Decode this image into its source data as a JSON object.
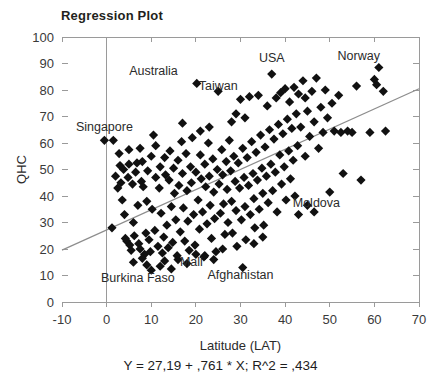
{
  "chart_data": {
    "type": "scatter",
    "title": "Regression Plot",
    "xlabel": "Latitude (LAT)",
    "ylabel": "QHC",
    "xlim": [
      -10,
      70
    ],
    "ylim": [
      0,
      100
    ],
    "xticks": [
      -10,
      0,
      10,
      20,
      30,
      40,
      50,
      60,
      70
    ],
    "yticks": [
      0,
      10,
      20,
      30,
      40,
      50,
      60,
      70,
      80,
      90,
      100
    ],
    "grid": "vertical-at-x0",
    "legend": "none",
    "equation": "Y = 27,19 + ,761 * X; R^2 = ,434",
    "fit": {
      "intercept": 27.19,
      "slope": 0.761,
      "r_squared": 0.434,
      "x_start": -10,
      "y_start": 19.58,
      "x_end": 70,
      "y_end": 80.46
    },
    "marker": {
      "shape": "diamond",
      "color": "#111111",
      "size": 7
    },
    "annotations": [
      {
        "text": "Australia",
        "x": 10.5,
        "y": 85.5
      },
      {
        "text": "Taiwan",
        "x": 25.0,
        "y": 80.0
      },
      {
        "text": "USA",
        "x": 37.0,
        "y": 90.5
      },
      {
        "text": "Norway",
        "x": 56.5,
        "y": 91.5
      },
      {
        "text": "Singapore",
        "x": -0.5,
        "y": 64.5
      },
      {
        "text": "Moldova",
        "x": 47.0,
        "y": 36.0
      },
      {
        "text": "Mali",
        "x": 19.0,
        "y": 13.5
      },
      {
        "text": "Afghanistan",
        "x": 30.0,
        "y": 8.5
      },
      {
        "text": "Burkina Faso",
        "x": 7.0,
        "y": 7.5
      }
    ],
    "points": [
      [
        -0.5,
        61.0
      ],
      [
        1.5,
        61.0
      ],
      [
        1.2,
        28.0
      ],
      [
        2.0,
        47.5
      ],
      [
        2.5,
        43.0
      ],
      [
        3.0,
        51.5
      ],
      [
        3.2,
        45.0
      ],
      [
        3.5,
        38.5
      ],
      [
        3.8,
        50.0
      ],
      [
        4.0,
        33.0
      ],
      [
        4.2,
        24.0
      ],
      [
        4.5,
        23.0
      ],
      [
        4.8,
        47.0
      ],
      [
        5.0,
        52.0
      ],
      [
        5.2,
        21.5
      ],
      [
        5.5,
        19.5
      ],
      [
        5.8,
        44.5
      ],
      [
        6.0,
        30.0
      ],
      [
        6.2,
        25.0
      ],
      [
        6.5,
        49.0
      ],
      [
        6.8,
        52.5
      ],
      [
        7.0,
        36.5
      ],
      [
        7.2,
        22.0
      ],
      [
        7.5,
        20.0
      ],
      [
        7.8,
        45.5
      ],
      [
        8.0,
        53.0
      ],
      [
        8.2,
        43.5
      ],
      [
        8.5,
        18.0
      ],
      [
        8.8,
        26.0
      ],
      [
        9.0,
        38.0
      ],
      [
        9.2,
        49.5
      ],
      [
        9.5,
        23.5
      ],
      [
        9.8,
        19.0
      ],
      [
        10.0,
        55.0
      ],
      [
        10.2,
        35.0
      ],
      [
        10.5,
        63.0
      ],
      [
        10.8,
        27.0
      ],
      [
        11.0,
        47.0
      ],
      [
        11.5,
        21.0
      ],
      [
        11.8,
        43.0
      ],
      [
        12.0,
        51.0
      ],
      [
        12.2,
        33.5
      ],
      [
        12.5,
        18.5
      ],
      [
        12.8,
        24.5
      ],
      [
        13.0,
        54.5
      ],
      [
        13.2,
        48.0
      ],
      [
        13.5,
        29.0
      ],
      [
        13.8,
        20.5
      ],
      [
        14.0,
        46.0
      ],
      [
        14.2,
        57.0
      ],
      [
        14.5,
        36.0
      ],
      [
        14.8,
        22.5
      ],
      [
        15.0,
        50.5
      ],
      [
        15.2,
        41.0
      ],
      [
        15.5,
        31.0
      ],
      [
        15.8,
        17.5
      ],
      [
        16.0,
        53.5
      ],
      [
        16.2,
        44.0
      ],
      [
        16.5,
        26.5
      ],
      [
        16.8,
        60.5
      ],
      [
        17.0,
        48.5
      ],
      [
        17.2,
        35.5
      ],
      [
        17.5,
        23.0
      ],
      [
        17.8,
        56.0
      ],
      [
        18.0,
        42.0
      ],
      [
        18.2,
        30.5
      ],
      [
        18.5,
        19.5
      ],
      [
        18.8,
        51.0
      ],
      [
        19.0,
        45.0
      ],
      [
        19.2,
        62.0
      ],
      [
        19.5,
        33.0
      ],
      [
        19.8,
        21.5
      ],
      [
        20.0,
        49.0
      ],
      [
        20.2,
        82.5
      ],
      [
        20.5,
        38.5
      ],
      [
        20.8,
        27.5
      ],
      [
        21.0,
        55.5
      ],
      [
        21.2,
        46.5
      ],
      [
        21.5,
        34.0
      ],
      [
        21.8,
        17.0
      ],
      [
        22.0,
        52.0
      ],
      [
        22.2,
        43.5
      ],
      [
        22.5,
        29.5
      ],
      [
        22.8,
        60.0
      ],
      [
        23.0,
        47.5
      ],
      [
        23.2,
        36.5
      ],
      [
        23.5,
        24.0
      ],
      [
        23.8,
        54.0
      ],
      [
        24.0,
        41.5
      ],
      [
        24.2,
        31.5
      ],
      [
        24.5,
        19.0
      ],
      [
        24.8,
        50.0
      ],
      [
        25.0,
        79.5
      ],
      [
        25.2,
        44.5
      ],
      [
        25.5,
        33.5
      ],
      [
        25.8,
        57.5
      ],
      [
        26.0,
        48.0
      ],
      [
        26.2,
        37.0
      ],
      [
        26.5,
        25.5
      ],
      [
        26.8,
        53.0
      ],
      [
        27.0,
        42.5
      ],
      [
        27.2,
        30.0
      ],
      [
        27.5,
        61.0
      ],
      [
        27.8,
        49.5
      ],
      [
        28.0,
        38.0
      ],
      [
        28.2,
        26.0
      ],
      [
        28.5,
        55.0
      ],
      [
        28.8,
        45.5
      ],
      [
        29.0,
        34.5
      ],
      [
        29.2,
        21.0
      ],
      [
        29.5,
        52.5
      ],
      [
        29.8,
        43.0
      ],
      [
        30.0,
        76.5
      ],
      [
        30.2,
        31.0
      ],
      [
        30.5,
        58.0
      ],
      [
        30.8,
        47.0
      ],
      [
        31.0,
        36.0
      ],
      [
        31.2,
        23.5
      ],
      [
        31.5,
        54.5
      ],
      [
        31.8,
        44.0
      ],
      [
        32.0,
        77.5
      ],
      [
        32.2,
        33.0
      ],
      [
        32.5,
        60.5
      ],
      [
        32.8,
        48.5
      ],
      [
        33.0,
        39.0
      ],
      [
        33.2,
        28.0
      ],
      [
        33.5,
        56.5
      ],
      [
        33.8,
        46.0
      ],
      [
        34.0,
        78.0
      ],
      [
        34.2,
        35.0
      ],
      [
        34.5,
        63.0
      ],
      [
        34.8,
        50.5
      ],
      [
        35.0,
        41.0
      ],
      [
        35.2,
        29.0
      ],
      [
        35.5,
        58.5
      ],
      [
        35.8,
        47.5
      ],
      [
        36.0,
        74.0
      ],
      [
        36.2,
        37.5
      ],
      [
        36.5,
        65.0
      ],
      [
        36.8,
        52.0
      ],
      [
        37.0,
        86.0
      ],
      [
        37.2,
        42.0
      ],
      [
        37.5,
        61.5
      ],
      [
        37.8,
        49.0
      ],
      [
        38.0,
        77.0
      ],
      [
        38.2,
        34.0
      ],
      [
        38.5,
        67.0
      ],
      [
        38.8,
        55.5
      ],
      [
        39.0,
        79.0
      ],
      [
        39.2,
        44.5
      ],
      [
        39.5,
        63.5
      ],
      [
        39.8,
        51.0
      ],
      [
        40.0,
        80.5
      ],
      [
        40.2,
        38.5
      ],
      [
        40.5,
        69.0
      ],
      [
        40.8,
        57.0
      ],
      [
        41.0,
        75.5
      ],
      [
        41.2,
        46.5
      ],
      [
        41.5,
        65.5
      ],
      [
        41.8,
        53.5
      ],
      [
        42.0,
        81.0
      ],
      [
        42.2,
        40.0
      ],
      [
        42.5,
        71.0
      ],
      [
        42.8,
        59.0
      ],
      [
        43.0,
        78.5
      ],
      [
        43.5,
        66.0
      ],
      [
        44.0,
        83.5
      ],
      [
        44.5,
        55.0
      ],
      [
        45.0,
        72.0
      ],
      [
        45.5,
        62.5
      ],
      [
        46.0,
        79.5
      ],
      [
        46.5,
        68.0
      ],
      [
        47.0,
        84.5
      ],
      [
        47.5,
        58.0
      ],
      [
        48.0,
        73.5
      ],
      [
        48.5,
        64.0
      ],
      [
        49.0,
        80.0
      ],
      [
        49.5,
        69.5
      ],
      [
        50.0,
        41.5
      ],
      [
        50.5,
        75.0
      ],
      [
        51.0,
        64.5
      ],
      [
        52.0,
        78.0
      ],
      [
        52.5,
        64.0
      ],
      [
        53.0,
        48.5
      ],
      [
        54.0,
        64.5
      ],
      [
        55.0,
        64.0
      ],
      [
        56.0,
        81.5
      ],
      [
        57.0,
        46.0
      ],
      [
        59.0,
        64.0
      ],
      [
        60.0,
        84.0
      ],
      [
        60.5,
        82.0
      ],
      [
        61.0,
        88.5
      ],
      [
        62.0,
        79.5
      ],
      [
        62.5,
        64.5
      ],
      [
        30.5,
        13.0
      ],
      [
        18.0,
        14.5
      ],
      [
        9.0,
        14.0
      ],
      [
        12.0,
        13.5
      ],
      [
        13.0,
        15.5
      ],
      [
        14.5,
        12.5
      ],
      [
        10.0,
        12.0
      ],
      [
        6.0,
        15.0
      ],
      [
        8.0,
        16.5
      ],
      [
        16.0,
        16.0
      ],
      [
        20.0,
        18.0
      ],
      [
        22.0,
        17.5
      ],
      [
        24.0,
        16.0
      ],
      [
        26.0,
        20.0
      ],
      [
        2.8,
        56.0
      ],
      [
        33.0,
        22.0
      ],
      [
        35.0,
        24.5
      ],
      [
        5.0,
        57.5
      ],
      [
        7.5,
        58.0
      ],
      [
        11.0,
        59.0
      ],
      [
        43.0,
        33.0
      ],
      [
        45.0,
        36.5
      ],
      [
        46.5,
        34.0
      ],
      [
        28.0,
        68.0
      ],
      [
        29.0,
        71.0
      ],
      [
        31.0,
        69.5
      ],
      [
        23.0,
        66.0
      ],
      [
        21.0,
        64.5
      ],
      [
        17.0,
        67.5
      ],
      [
        44.5,
        77.0
      ]
    ]
  }
}
